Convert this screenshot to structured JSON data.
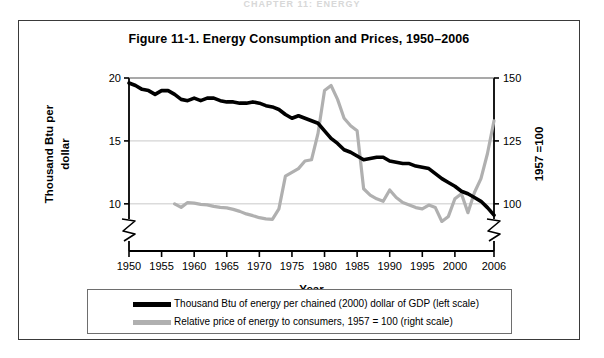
{
  "page": {
    "running_head": "CHAPTER 11: ENERGY"
  },
  "figure": {
    "title": "Figure 11-1. Energy Consumption and Prices, 1950–2006"
  },
  "axes": {
    "y_left": {
      "label": "Thousand Btu per dollar",
      "ticks": [
        "10",
        "15",
        "20"
      ],
      "tick_values": [
        10,
        15,
        20
      ],
      "has_axis_break": true
    },
    "y_right": {
      "label": "1957 =100",
      "ticks": [
        "100",
        "125",
        "150"
      ],
      "tick_values": [
        100,
        125,
        150
      ],
      "has_axis_break": true
    },
    "x": {
      "label": "Year",
      "ticks": [
        "1950",
        "1955",
        "1960",
        "1965",
        "1970",
        "1975",
        "1980",
        "1985",
        "1990",
        "1995",
        "2000",
        "2006"
      ],
      "tick_values": [
        1950,
        1955,
        1960,
        1965,
        1970,
        1975,
        1980,
        1985,
        1990,
        1995,
        2000,
        2006
      ]
    }
  },
  "legend": {
    "items": [
      {
        "swatch": "black",
        "label": "Thousand Btu of energy per chained (2000) dollar of GDP (left scale)"
      },
      {
        "swatch": "gray",
        "label": "Relative price of energy to consumers, 1957 = 100 (right scale)"
      }
    ]
  },
  "colors": {
    "series_btu": "#000000",
    "series_price": "#b0b0b0",
    "gridline": "#c9c9c9",
    "axis": "#000000",
    "frame": "#3a3a3a"
  },
  "chart_data": {
    "type": "line",
    "title": "Figure 11-1. Energy Consumption and Prices, 1950–2006",
    "xlabel": "Year",
    "ylabel": "Thousand Btu per dollar",
    "ylabel_right": "1957 =100",
    "xlim": [
      1950,
      2006
    ],
    "ylim_left": [
      8.0,
      20.0
    ],
    "ylim_right": [
      90,
      150
    ],
    "grid": true,
    "gridlines_left": [
      10,
      15
    ],
    "legend_position": "below-plot",
    "series": [
      {
        "name": "Thousand Btu of energy per chained (2000) dollar of GDP (left scale)",
        "axis": "left",
        "color": "#000000",
        "x": [
          1950,
          1951,
          1952,
          1953,
          1954,
          1955,
          1956,
          1957,
          1958,
          1959,
          1960,
          1961,
          1962,
          1963,
          1964,
          1965,
          1966,
          1967,
          1968,
          1969,
          1970,
          1971,
          1972,
          1973,
          1974,
          1975,
          1976,
          1977,
          1978,
          1979,
          1980,
          1981,
          1982,
          1983,
          1984,
          1985,
          1986,
          1987,
          1988,
          1989,
          1990,
          1991,
          1992,
          1993,
          1994,
          1995,
          1996,
          1997,
          1998,
          1999,
          2000,
          2001,
          2002,
          2003,
          2004,
          2005,
          2006
        ],
        "y": [
          19.6,
          19.4,
          19.1,
          19.0,
          18.7,
          19.0,
          19.0,
          18.7,
          18.3,
          18.2,
          18.4,
          18.2,
          18.4,
          18.4,
          18.2,
          18.1,
          18.1,
          18.0,
          18.0,
          18.1,
          18.0,
          17.8,
          17.7,
          17.5,
          17.1,
          16.8,
          17.0,
          16.8,
          16.6,
          16.4,
          15.8,
          15.2,
          14.8,
          14.3,
          14.1,
          13.8,
          13.5,
          13.6,
          13.7,
          13.7,
          13.4,
          13.3,
          13.2,
          13.2,
          13.0,
          12.9,
          12.8,
          12.4,
          12.0,
          11.7,
          11.4,
          11.0,
          10.8,
          10.5,
          10.2,
          9.7,
          9.1
        ]
      },
      {
        "name": "Relative price of energy to consumers, 1957 = 100 (right scale)",
        "axis": "right",
        "color": "#b0b0b0",
        "x": [
          1957,
          1958,
          1959,
          1960,
          1961,
          1962,
          1963,
          1964,
          1965,
          1966,
          1967,
          1968,
          1969,
          1970,
          1971,
          1972,
          1973,
          1974,
          1975,
          1976,
          1977,
          1978,
          1979,
          1980,
          1981,
          1982,
          1983,
          1984,
          1985,
          1986,
          1987,
          1988,
          1989,
          1990,
          1991,
          1992,
          1993,
          1994,
          1995,
          1996,
          1997,
          1998,
          1999,
          2000,
          2001,
          2002,
          2003,
          2004,
          2005,
          2006
        ],
        "y": [
          100.0,
          98.6,
          100.5,
          100.3,
          99.8,
          99.6,
          99.0,
          98.6,
          98.4,
          97.8,
          97.0,
          96.0,
          95.3,
          94.5,
          94.0,
          93.8,
          98.0,
          111.0,
          112.5,
          114.0,
          117.0,
          117.5,
          128.0,
          145.0,
          147.0,
          141.5,
          134.0,
          131.0,
          129.0,
          106.0,
          103.5,
          102.0,
          101.0,
          105.5,
          102.5,
          100.5,
          99.5,
          98.5,
          98.0,
          99.5,
          98.5,
          93.0,
          95.0,
          102.0,
          104.0,
          96.5,
          104.5,
          110.0,
          120.0,
          133.0
        ]
      }
    ]
  }
}
